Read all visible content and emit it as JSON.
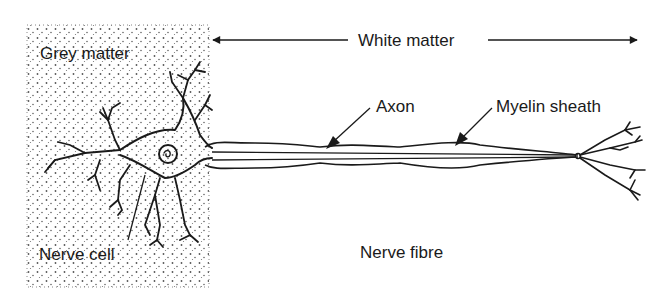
{
  "diagram": {
    "labels": {
      "grey_matter": "Grey matter",
      "white_matter": "White matter",
      "axon": "Axon",
      "myelin_sheath": "Myelin sheath",
      "nerve_cell": "Nerve cell",
      "nerve_fibre": "Nerve fibre"
    },
    "colors": {
      "ink": "#1a1a1a",
      "background": "#ffffff",
      "stipple": "#555555"
    }
  }
}
